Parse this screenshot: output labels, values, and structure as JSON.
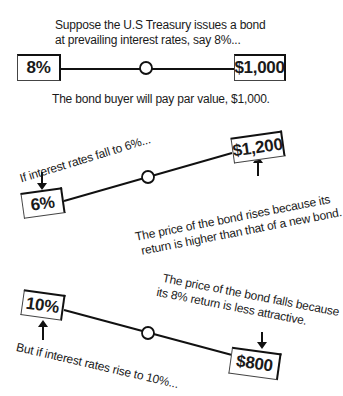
{
  "scenario_par": {
    "caption_top_line1": "Suppose the U.S Treasury issues a bond",
    "caption_top_line2": "at prevailing interest rates, say 8%...",
    "rate_label": "8%",
    "price_label": "$1,000",
    "caption_bottom": "The bond buyer will pay par value,  $1,000."
  },
  "scenario_fall": {
    "rate_caption": "If interest rates fall to 6%...",
    "rate_label": "6%",
    "price_label": "$1,200",
    "explanation_line1": "The price of the bond rises because its",
    "explanation_line2": "return is higher than that of a new bond."
  },
  "scenario_rise": {
    "explanation_line1": "The price of the bond falls because",
    "explanation_line2": "its 8% return is less attractive.",
    "rate_label": "10%",
    "price_label": "$800",
    "rate_caption": "But if interest rates rise to 10%..."
  },
  "icons": {
    "fulcrum": "circle",
    "arrow": "down/up arrow"
  }
}
